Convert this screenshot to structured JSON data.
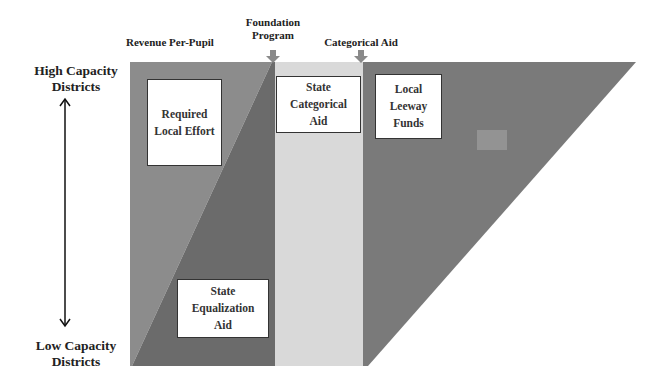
{
  "top_labels": {
    "revenue": "Revenue Per-Pupil",
    "foundation": "Foundation Program",
    "categorical": "Categorical Aid"
  },
  "axis": {
    "high": "High Capacity Districts",
    "low": "Low Capacity Districts"
  },
  "regions": {
    "required_local_effort": "Required Local Effort",
    "state_categorical_aid": "State Categorical Aid",
    "local_leeway_funds": "Local Leeway Funds",
    "state_equalization_aid": "State Equalization Aid"
  },
  "colors": {
    "medium_gray": "#8a8a8a",
    "dark_gray": "#6e6e6e",
    "light_gray": "#d8d8d8",
    "leeway_gray": "#797979",
    "marker": "#9a9a9a"
  }
}
